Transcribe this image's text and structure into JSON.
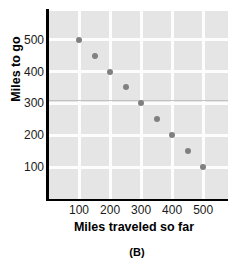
{
  "caption": "(B)",
  "chart_data": {
    "type": "scatter",
    "title": "",
    "xlabel": "Miles traveled so far",
    "ylabel": "Miles to go",
    "xlim": [
      0,
      580
    ],
    "ylim": [
      0,
      590
    ],
    "xticks": [
      100,
      200,
      300,
      400,
      500
    ],
    "yticks": [
      100,
      200,
      300,
      400,
      500
    ],
    "xtick_labels": [
      "100",
      "200",
      "300",
      "400",
      "500"
    ],
    "ytick_labels": [
      "100",
      "200",
      "300",
      "400",
      "500"
    ],
    "grid": true,
    "legend": "none",
    "x": [
      100,
      150,
      200,
      250,
      300,
      350,
      400,
      450,
      500
    ],
    "y": [
      500,
      450,
      400,
      350,
      300,
      250,
      200,
      150,
      100
    ],
    "points": [
      {
        "x": 100,
        "y": 500
      },
      {
        "x": 150,
        "y": 450
      },
      {
        "x": 200,
        "y": 400
      },
      {
        "x": 250,
        "y": 350
      },
      {
        "x": 300,
        "y": 300
      },
      {
        "x": 350,
        "y": 250
      },
      {
        "x": 400,
        "y": 200
      },
      {
        "x": 450,
        "y": 150
      },
      {
        "x": 500,
        "y": 100
      }
    ],
    "marker_color": "#808080",
    "plot_background": "#e5e5e5",
    "gridline_color": "#fdfdfd",
    "axis_color": "#000000",
    "annotations": [
      {
        "type": "hline",
        "y": 310,
        "color": "#c2c2c2"
      }
    ]
  }
}
